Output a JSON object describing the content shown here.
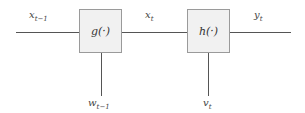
{
  "diagram": {
    "blocks": [
      {
        "id": "g",
        "label": "g(·)"
      },
      {
        "id": "h",
        "label": "h(·)"
      }
    ],
    "signals": {
      "input": {
        "base": "x",
        "sub": "t−1"
      },
      "middle": {
        "base": "x",
        "sub": "t"
      },
      "output": {
        "base": "y",
        "sub": "t"
      },
      "noise_g": {
        "base": "w",
        "sub": "t−1"
      },
      "noise_h": {
        "base": "v",
        "sub": "t"
      }
    },
    "colors": {
      "line": "#555555",
      "box_fill": "#f1f1f1",
      "box_border": "#9a9a9a"
    }
  }
}
